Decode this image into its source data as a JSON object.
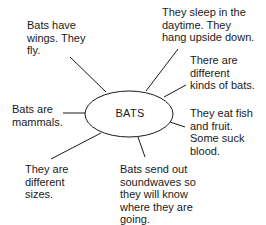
{
  "diagram": {
    "type": "concept-web",
    "center": {
      "label": "BATS"
    },
    "nodes": [
      {
        "id": "wings",
        "text": "Bats have\nwings. They\nfly."
      },
      {
        "id": "sleep",
        "text": "They sleep in the\ndaytime. They\nhang upside down."
      },
      {
        "id": "kinds",
        "text": "There are\ndifferent\nkinds of bats."
      },
      {
        "id": "eat",
        "text": "They eat fish\nand fruit.\nSome suck\nblood."
      },
      {
        "id": "mammals",
        "text": "Bats are\nmammals."
      },
      {
        "id": "sizes",
        "text": "They are\ndifferent\nsizes."
      },
      {
        "id": "soundwaves",
        "text": "Bats send out\nsoundwaves so\nthey will know\nwhere they are\ngoing."
      }
    ],
    "colors": {
      "line": "#1a1a1a",
      "text": "#1a1a1a",
      "background": "#ffffff"
    }
  }
}
